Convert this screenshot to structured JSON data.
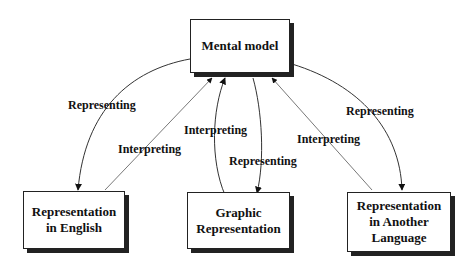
{
  "nodes": {
    "mental_model": "Mental model",
    "english": "Representation in English",
    "graphic": "Graphic Representation",
    "another_language": "Representation in Another Language"
  },
  "edge_labels": {
    "representing_english": "Representing",
    "interpreting_english": "Interpreting",
    "interpreting_graphic": "Interpreting",
    "representing_graphic": "Representing",
    "interpreting_another": "Interpreting",
    "representing_another": "Representing"
  }
}
